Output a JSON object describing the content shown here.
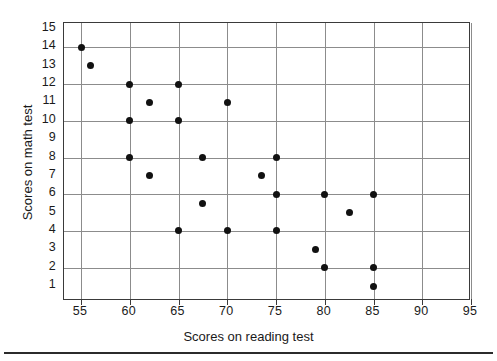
{
  "chart_data": {
    "type": "scatter",
    "title": "",
    "xlabel": "Scores on reading test",
    "ylabel": "Scores on math test",
    "xlim": [
      53,
      95
    ],
    "ylim": [
      0,
      15
    ],
    "xticks": [
      55,
      60,
      65,
      70,
      75,
      80,
      85,
      90,
      95
    ],
    "yticks": [
      1,
      2,
      3,
      4,
      5,
      6,
      7,
      8,
      9,
      10,
      11,
      12,
      13,
      14,
      15
    ],
    "xgrid_values": [
      55,
      60,
      65,
      70,
      75,
      80,
      85,
      90,
      95
    ],
    "ygrid_values": [
      2,
      4,
      6,
      8,
      10,
      12,
      14,
      15
    ],
    "grid": true,
    "legend": false,
    "marker": "filled-circle",
    "marker_color": "#111111",
    "points": [
      {
        "x": 55,
        "y": 14
      },
      {
        "x": 56,
        "y": 13
      },
      {
        "x": 60,
        "y": 12
      },
      {
        "x": 60,
        "y": 10
      },
      {
        "x": 60,
        "y": 8
      },
      {
        "x": 62,
        "y": 11
      },
      {
        "x": 62,
        "y": 7
      },
      {
        "x": 65,
        "y": 12
      },
      {
        "x": 65,
        "y": 10
      },
      {
        "x": 65,
        "y": 4
      },
      {
        "x": 67.5,
        "y": 8
      },
      {
        "x": 67.5,
        "y": 5.5
      },
      {
        "x": 70,
        "y": 11
      },
      {
        "x": 70,
        "y": 4
      },
      {
        "x": 73.5,
        "y": 7
      },
      {
        "x": 75,
        "y": 8
      },
      {
        "x": 75,
        "y": 6
      },
      {
        "x": 75,
        "y": 4
      },
      {
        "x": 79,
        "y": 3
      },
      {
        "x": 80,
        "y": 6
      },
      {
        "x": 80,
        "y": 2
      },
      {
        "x": 82.5,
        "y": 5
      },
      {
        "x": 85,
        "y": 6
      },
      {
        "x": 85,
        "y": 2
      },
      {
        "x": 85,
        "y": 1
      }
    ]
  },
  "axis": {
    "x_tick_labels": [
      "55",
      "60",
      "65",
      "70",
      "75",
      "80",
      "85",
      "90",
      "95"
    ],
    "y_tick_labels": [
      "15",
      "14",
      "13",
      "12",
      "11",
      "10",
      "9",
      "8",
      "7",
      "6",
      "5",
      "4",
      "3",
      "2",
      "1"
    ],
    "x_title": "Scores on reading test",
    "y_title": "Scores on math test"
  },
  "colors": {
    "marker": "#111111",
    "grid": "#8c8c8c",
    "frame": "#3a3a3a",
    "background": "#ffffff",
    "rule": "#2b2b2b"
  }
}
